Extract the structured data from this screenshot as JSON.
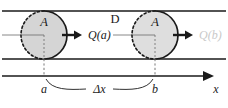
{
  "figure": {
    "name": "flux-through-pipe-diagram",
    "region_label": "D",
    "colors": {
      "line": "#1a1a1a",
      "disk_fill": "#d5d5d5",
      "disk_fill_light": "#dedede",
      "disk_edge": "#1a1a1a",
      "faint_text": "#c9c9c9",
      "axis": "#1a1a1a"
    },
    "disks": [
      {
        "id": "left-disk",
        "area_label": "A",
        "flux_label": "Q(a)",
        "position_label": "a",
        "faint": false
      },
      {
        "id": "right-disk",
        "area_label": "A",
        "flux_label": "Q(b)",
        "position_label": "b",
        "faint": true
      }
    ],
    "axis": {
      "label": "x",
      "tick_labels": [
        "a",
        "b"
      ]
    },
    "span": {
      "label": "Δx"
    }
  }
}
